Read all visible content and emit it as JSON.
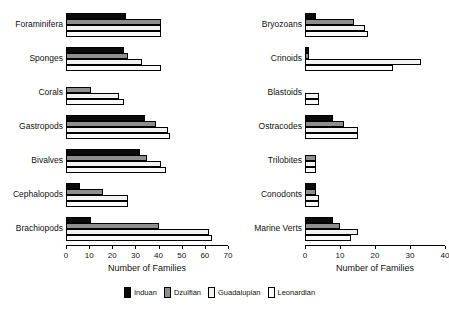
{
  "chart_data": [
    {
      "type": "bar",
      "orientation": "horizontal",
      "panel": "left",
      "title": "",
      "xlabel": "Number of Families",
      "ylabel": "",
      "xlim": [
        0,
        70
      ],
      "xticks": [
        0,
        10,
        20,
        30,
        40,
        50,
        60,
        70
      ],
      "grid": false,
      "categories": [
        "Foraminifera",
        "Sponges",
        "Corals",
        "Gastropods",
        "Bivalves",
        "Cephalopods",
        "Brachiopods"
      ],
      "series": [
        {
          "name": "Induan",
          "color": "#0b0b0b",
          "values": [
            26,
            25,
            0,
            34,
            32,
            6,
            11
          ]
        },
        {
          "name": "Dzulfian",
          "color": "#8e8e8e",
          "values": [
            41,
            27,
            11,
            39,
            35,
            16,
            40
          ]
        },
        {
          "name": "Guadalupian",
          "color": "#f2f2f2",
          "values": [
            41,
            33,
            23,
            44,
            41,
            27,
            62
          ]
        },
        {
          "name": "Leonardian",
          "color": "#fbfbfb",
          "values": [
            41,
            41,
            25,
            45,
            43,
            27,
            63
          ]
        }
      ]
    },
    {
      "type": "bar",
      "orientation": "horizontal",
      "panel": "right",
      "title": "",
      "xlabel": "Number of Families",
      "ylabel": "",
      "xlim": [
        0,
        40
      ],
      "xticks": [
        0,
        10,
        20,
        30,
        40
      ],
      "grid": false,
      "categories": [
        "Bryozoans",
        "Crinoids",
        "Blastoids",
        "Ostracodes",
        "Trilobites",
        "Conodonts",
        "Marine Verts"
      ],
      "series": [
        {
          "name": "Induan",
          "color": "#0b0b0b",
          "values": [
            3,
            1,
            0,
            8,
            0,
            3,
            8
          ]
        },
        {
          "name": "Dzulfian",
          "color": "#8e8e8e",
          "values": [
            14,
            1,
            0,
            11,
            3,
            3,
            10
          ]
        },
        {
          "name": "Guadalupian",
          "color": "#f2f2f2",
          "values": [
            17,
            33,
            4,
            15,
            3,
            4,
            15
          ]
        },
        {
          "name": "Leonardian",
          "color": "#fbfbfb",
          "values": [
            18,
            25,
            4,
            15,
            3,
            4,
            13
          ]
        }
      ]
    }
  ],
  "legend": {
    "position": "bottom-center",
    "items": [
      {
        "label": "Induan",
        "color": "#0b0b0b"
      },
      {
        "label": "Dzulfian",
        "color": "#8e8e8e"
      },
      {
        "label": "Guadalupian",
        "color": "#f2f2f2"
      },
      {
        "label": "Leonardian",
        "color": "#fbfbfb"
      }
    ]
  }
}
